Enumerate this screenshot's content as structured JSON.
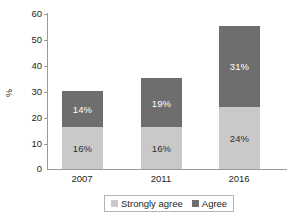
{
  "chart_data": {
    "type": "bar",
    "stacked": true,
    "title": "",
    "subtitle": "",
    "xlabel": "",
    "ylabel": "%",
    "ylim": [
      0,
      60
    ],
    "ytick_step": 10,
    "ytick_labels": [
      "60",
      "50",
      "40",
      "30",
      "20",
      "10",
      "0"
    ],
    "ytick_values": [
      60,
      50,
      40,
      30,
      20,
      10,
      0
    ],
    "grid": false,
    "legend_position": "bottom",
    "categories": [
      "2007",
      "2011",
      "2016"
    ],
    "series": [
      {
        "name": "Strongly agree",
        "color": "#c9c9c9",
        "values": [
          16,
          16,
          24
        ],
        "labels": [
          "16%",
          "16%",
          "24%"
        ]
      },
      {
        "name": "Agree",
        "color": "#6e6e6e",
        "values": [
          14,
          19,
          31
        ],
        "labels": [
          "14%",
          "19%",
          "31%"
        ]
      }
    ],
    "totals": [
      30,
      35,
      55
    ],
    "axis_color": "#9a9a9a"
  }
}
